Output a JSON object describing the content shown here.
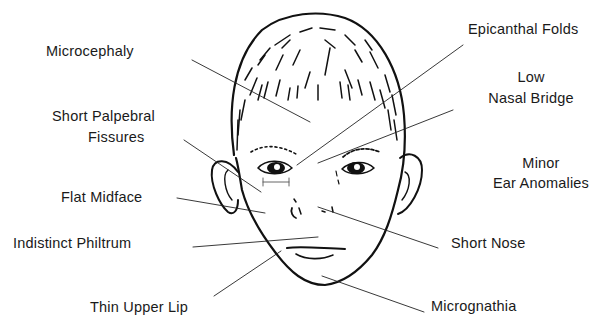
{
  "diagram": {
    "line_color": "#111111",
    "labels": {
      "microcephaly": "Microcephaly",
      "epicanthal_folds": "Epicanthal Folds",
      "low_nasal_bridge_1": "Low",
      "low_nasal_bridge_2": "Nasal Bridge",
      "short_palpebral_1": "Short Palpebral",
      "short_palpebral_2": "Fissures",
      "minor_ear_1": "Minor",
      "minor_ear_2": "Ear Anomalies",
      "flat_midface": "Flat Midface",
      "indistinct_philtrum": "Indistinct Philtrum",
      "short_nose": "Short Nose",
      "thin_upper_lip": "Thin Upper Lip",
      "micrognathia": "Micrognathia"
    }
  }
}
